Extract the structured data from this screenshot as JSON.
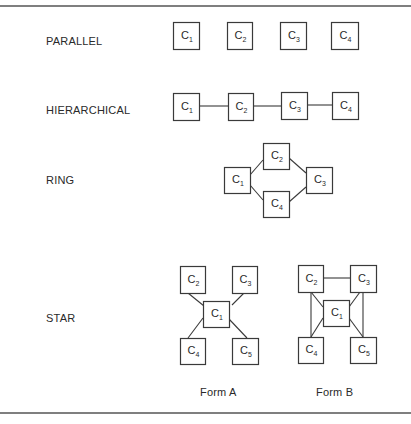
{
  "diagram": {
    "rows": [
      {
        "id": "parallel",
        "label": "PARALLEL",
        "label_pos": [
          46,
          45
        ],
        "nodes": [
          {
            "id": "C1",
            "letter": "C",
            "sub": "1",
            "x": 173,
            "y": 22,
            "w": 26,
            "h": 27
          },
          {
            "id": "C2",
            "letter": "C",
            "sub": "2",
            "x": 227,
            "y": 22,
            "w": 25,
            "h": 27
          },
          {
            "id": "C3",
            "letter": "C",
            "sub": "3",
            "x": 280,
            "y": 22,
            "w": 26,
            "h": 27
          },
          {
            "id": "C4",
            "letter": "C",
            "sub": "4",
            "x": 331,
            "y": 22,
            "w": 27,
            "h": 27
          }
        ],
        "edges": []
      },
      {
        "id": "hierarchical",
        "label": "HIERARCHICAL",
        "label_pos": [
          46,
          114
        ],
        "nodes": [
          {
            "id": "C1",
            "letter": "C",
            "sub": "1",
            "x": 173,
            "y": 93,
            "w": 26,
            "h": 27
          },
          {
            "id": "C2",
            "letter": "C",
            "sub": "2",
            "x": 228,
            "y": 93,
            "w": 25,
            "h": 27
          },
          {
            "id": "C3",
            "letter": "C",
            "sub": "3",
            "x": 281,
            "y": 92,
            "w": 26,
            "h": 27
          },
          {
            "id": "C4",
            "letter": "C",
            "sub": "4",
            "x": 332,
            "y": 92,
            "w": 26,
            "h": 27
          }
        ],
        "edges": [
          [
            199,
            106,
            228,
            106
          ],
          [
            253,
            106,
            281,
            106
          ],
          [
            307,
            105,
            332,
            105
          ]
        ]
      },
      {
        "id": "ring",
        "label": "RING",
        "label_pos": [
          46,
          184
        ],
        "nodes": [
          {
            "id": "C2",
            "letter": "C",
            "sub": "2",
            "x": 263,
            "y": 143,
            "w": 26,
            "h": 26
          },
          {
            "id": "C1",
            "letter": "C",
            "sub": "1",
            "x": 224,
            "y": 167,
            "w": 26,
            "h": 26
          },
          {
            "id": "C3",
            "letter": "C",
            "sub": "3",
            "x": 306,
            "y": 167,
            "w": 26,
            "h": 26
          },
          {
            "id": "C4",
            "letter": "C",
            "sub": "4",
            "x": 263,
            "y": 191,
            "w": 26,
            "h": 26
          }
        ],
        "edges": [
          [
            250,
            175,
            263,
            160
          ],
          [
            289,
            158,
            306,
            173
          ],
          [
            250,
            185,
            263,
            200
          ],
          [
            289,
            202,
            306,
            187
          ]
        ]
      },
      {
        "id": "star",
        "label": "STAR",
        "label_pos": [
          46,
          322
        ],
        "forms": [
          {
            "id": "form-a",
            "caption": "Form A",
            "caption_pos": [
              218,
              396
            ],
            "nodes": [
              {
                "id": "C2",
                "letter": "C",
                "sub": "2",
                "x": 180,
                "y": 266,
                "w": 25,
                "h": 27
              },
              {
                "id": "C3",
                "letter": "C",
                "sub": "3",
                "x": 232,
                "y": 266,
                "w": 25,
                "h": 27
              },
              {
                "id": "C1",
                "letter": "C",
                "sub": "1",
                "x": 203,
                "y": 301,
                "w": 26,
                "h": 26
              },
              {
                "id": "C4",
                "letter": "C",
                "sub": "4",
                "x": 180,
                "y": 338,
                "w": 25,
                "h": 26
              },
              {
                "id": "C5",
                "letter": "C",
                "sub": "5",
                "x": 232,
                "y": 338,
                "w": 26,
                "h": 26
              }
            ],
            "edges": [
              [
                188,
                293,
                204,
                306
              ],
              [
                244,
                293,
                232,
                305
              ],
              [
                203,
                318,
                188,
                338
              ],
              [
                229,
                319,
                247,
                338
              ]
            ]
          },
          {
            "id": "form-b",
            "caption": "Form B",
            "caption_pos": [
              333,
              396
            ],
            "nodes": [
              {
                "id": "C2",
                "letter": "C",
                "sub": "2",
                "x": 298,
                "y": 265,
                "w": 25,
                "h": 27
              },
              {
                "id": "C3",
                "letter": "C",
                "sub": "3",
                "x": 350,
                "y": 265,
                "w": 26,
                "h": 27
              },
              {
                "id": "C1",
                "letter": "C",
                "sub": "1",
                "x": 323,
                "y": 300,
                "w": 26,
                "h": 26
              },
              {
                "id": "C4",
                "letter": "C",
                "sub": "4",
                "x": 298,
                "y": 337,
                "w": 25,
                "h": 26
              },
              {
                "id": "C5",
                "letter": "C",
                "sub": "5",
                "x": 350,
                "y": 337,
                "w": 26,
                "h": 26
              }
            ],
            "edges": [
              [
                323,
                278,
                350,
                278
              ],
              [
                311,
                292,
                311,
                337
              ],
              [
                363,
                292,
                363,
                337
              ],
              [
                311,
                292,
                323,
                307
              ],
              [
                360,
                292,
                349,
                307
              ],
              [
                323,
                318,
                311,
                337
              ],
              [
                349,
                318,
                363,
                337
              ]
            ]
          }
        ]
      }
    ],
    "rules": {
      "top_y": 6,
      "bottom_y": 413
    }
  }
}
